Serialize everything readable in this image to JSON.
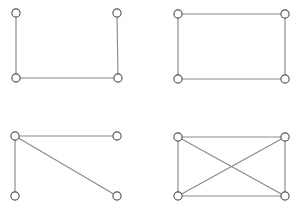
{
  "figure": {
    "width": 297,
    "height": 208,
    "background_color": "#ffffff",
    "edge_color": "#8a8a8a",
    "vertex_stroke_color": "#555555",
    "vertex_fill_color": "#ffffff",
    "vertex_radius": 4.1,
    "edge_width": 1.15,
    "layout": "2x2 grid of small graph diagrams, no labels or captions"
  },
  "chart_data": {
    "type": "diagram",
    "xlabel": "",
    "ylabel": "",
    "grid": false,
    "legend": false,
    "panel_count": 4,
    "panels": [
      {
        "id": "graph-top-left",
        "name": "path-graph-p4",
        "description": "U-shaped path: three edges, two vertices of degree 1 and two of degree 2",
        "vertex_count": 4,
        "edge_count": 3,
        "degree_sequence": [
          1,
          2,
          2,
          1
        ],
        "vertices": [
          {
            "id": "a",
            "label": "",
            "x": 16,
            "y": 13
          },
          {
            "id": "b",
            "label": "",
            "x": 117,
            "y": 13
          },
          {
            "id": "c",
            "label": "",
            "x": 16,
            "y": 78
          },
          {
            "id": "d",
            "label": "",
            "x": 118,
            "y": 78
          }
        ],
        "edges": [
          {
            "from": "a",
            "to": "c"
          },
          {
            "from": "c",
            "to": "d"
          },
          {
            "from": "d",
            "to": "b"
          }
        ]
      },
      {
        "id": "graph-top-right",
        "name": "cycle-graph-c4",
        "description": "Rectangle / four-cycle: four edges, every vertex has degree 2",
        "vertex_count": 4,
        "edge_count": 4,
        "degree_sequence": [
          2,
          2,
          2,
          2
        ],
        "vertices": [
          {
            "id": "a",
            "label": "",
            "x": 178,
            "y": 14
          },
          {
            "id": "b",
            "label": "",
            "x": 285,
            "y": 14
          },
          {
            "id": "c",
            "label": "",
            "x": 178,
            "y": 79
          },
          {
            "id": "d",
            "label": "",
            "x": 285,
            "y": 79
          }
        ],
        "edges": [
          {
            "from": "a",
            "to": "b"
          },
          {
            "from": "b",
            "to": "d"
          },
          {
            "from": "d",
            "to": "c"
          },
          {
            "from": "c",
            "to": "a"
          }
        ]
      },
      {
        "id": "graph-bottom-left",
        "name": "star-graph-k1-3",
        "description": "Claw / star: top-left vertex joined to the other three, including one diagonal",
        "vertex_count": 4,
        "edge_count": 3,
        "degree_sequence": [
          3,
          1,
          1,
          1
        ],
        "vertices": [
          {
            "id": "a",
            "label": "",
            "x": 15,
            "y": 136
          },
          {
            "id": "b",
            "label": "",
            "x": 117,
            "y": 136
          },
          {
            "id": "c",
            "label": "",
            "x": 15,
            "y": 196
          },
          {
            "id": "d",
            "label": "",
            "x": 117,
            "y": 196
          }
        ],
        "edges": [
          {
            "from": "a",
            "to": "b"
          },
          {
            "from": "a",
            "to": "c"
          },
          {
            "from": "a",
            "to": "d"
          }
        ]
      },
      {
        "id": "graph-bottom-right",
        "name": "complete-graph-k4",
        "description": "Complete graph: four rectangle sides plus both diagonals crossing at the centre",
        "vertex_count": 4,
        "edge_count": 6,
        "degree_sequence": [
          3,
          3,
          3,
          3
        ],
        "vertices": [
          {
            "id": "a",
            "label": "",
            "x": 178,
            "y": 137
          },
          {
            "id": "b",
            "label": "",
            "x": 285,
            "y": 137
          },
          {
            "id": "c",
            "label": "",
            "x": 178,
            "y": 196
          },
          {
            "id": "d",
            "label": "",
            "x": 285,
            "y": 196
          }
        ],
        "edges": [
          {
            "from": "a",
            "to": "b"
          },
          {
            "from": "c",
            "to": "d"
          },
          {
            "from": "a",
            "to": "c"
          },
          {
            "from": "b",
            "to": "d"
          },
          {
            "from": "a",
            "to": "d"
          },
          {
            "from": "b",
            "to": "c"
          }
        ]
      }
    ]
  }
}
